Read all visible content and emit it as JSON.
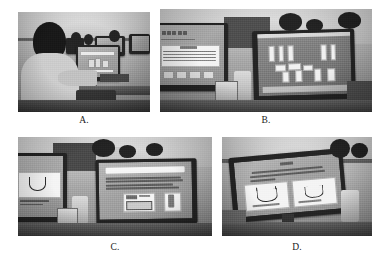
{
  "figure": {
    "background_color": "#ffffff",
    "layout": "2x2 grid of grayscale photographs with lettered captions",
    "panels": [
      {
        "id": "panel-a",
        "caption": "A.",
        "scene": "Student seen from behind seated at a desktop computer in a computer lab, other students and monitors visible in the background",
        "screen_content": "software interface with small colored elements"
      },
      {
        "id": "panel-b",
        "caption": "B.",
        "scene": "Two desktop monitors side by side on lab desks; students' heads visible behind the right monitor",
        "screen_content": "left monitor shows a titled text slide with a data table and a row of buttons; right monitor shows a virtual laboratory simulation with white apparatus shapes on a dark workbench"
      },
      {
        "id": "panel-c",
        "caption": "C.",
        "scene": "Two monitors at an angle with students seated behind them in a computer lab",
        "screen_content": "left monitor shows a U-shaped tube diagram on a white panel; right monitor shows a titled slide with paragraphs of text and two inset apparatus images"
      },
      {
        "id": "panel-d",
        "caption": "D.",
        "scene": "Single widescreen monitor viewed at an angle with a student partly visible at the right and a bottle on the desk",
        "screen_content": "slide with a centered heading, two lines of body text and two white panels each containing a U-shaped tube diagram"
      }
    ]
  }
}
